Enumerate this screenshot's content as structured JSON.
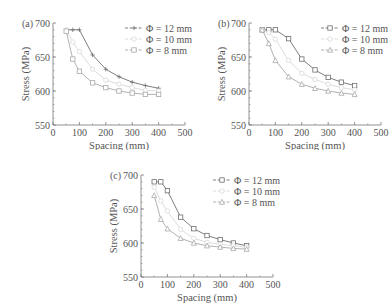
{
  "figure": {
    "colors": {
      "axis": "#777777",
      "s12": "#6f6f6f",
      "s10": "#d8d8d8",
      "s8": "#a8a8a8",
      "text": "#555555"
    }
  },
  "chart_data": [
    {
      "panel_label": "(a)",
      "type": "line",
      "title": "",
      "xlabel": "Spacing (mm)",
      "ylabel": "Stress (MPa)",
      "xlim": [
        0,
        500
      ],
      "ylim": [
        550,
        700
      ],
      "xticks": [
        0,
        100,
        200,
        300,
        400,
        500
      ],
      "yticks": [
        550,
        600,
        650,
        700
      ],
      "grid": false,
      "legend_position": "upper right",
      "x": [
        50,
        75,
        100,
        150,
        200,
        250,
        300,
        350,
        400
      ],
      "series": [
        {
          "name": "Φ = 12 mm",
          "marker": "plus",
          "values": [
            690,
            690,
            690,
            653,
            632,
            621,
            613,
            608,
            604
          ]
        },
        {
          "name": "Φ = 10 mm",
          "marker": "circle",
          "values": [
            690,
            672,
            658,
            632,
            616,
            610,
            605,
            601,
            600
          ]
        },
        {
          "name": "Φ = 8 mm",
          "marker": "square",
          "values": [
            688,
            647,
            629,
            612,
            605,
            600,
            597,
            595,
            595
          ]
        }
      ]
    },
    {
      "panel_label": "(b)",
      "type": "line",
      "title": "",
      "xlabel": "Spacing (mm)",
      "ylabel": "Stress (MPa)",
      "xlim": [
        0,
        500
      ],
      "ylim": [
        550,
        700
      ],
      "xticks": [
        0,
        100,
        200,
        300,
        400,
        500
      ],
      "yticks": [
        550,
        600,
        650,
        700
      ],
      "grid": false,
      "legend_position": "upper right",
      "x": [
        50,
        75,
        100,
        150,
        200,
        250,
        300,
        350,
        400
      ],
      "series": [
        {
          "name": "Φ = 12 mm",
          "marker": "square",
          "values": [
            690,
            690,
            690,
            677,
            647,
            631,
            620,
            613,
            608
          ]
        },
        {
          "name": "Φ = 10 mm",
          "marker": "circle",
          "values": [
            690,
            686,
            676,
            645,
            626,
            617,
            610,
            605,
            602
          ]
        },
        {
          "name": "Φ = 8 mm",
          "marker": "triangle",
          "values": [
            690,
            670,
            645,
            621,
            610,
            604,
            600,
            597,
            595
          ]
        }
      ]
    },
    {
      "panel_label": "(c)",
      "type": "line",
      "title": "",
      "xlabel": "Spacing (mm)",
      "ylabel": "Stress (MPa)",
      "xlim": [
        0,
        500
      ],
      "ylim": [
        550,
        700
      ],
      "xticks": [
        0,
        100,
        200,
        300,
        400,
        500
      ],
      "yticks": [
        550,
        600,
        650,
        700
      ],
      "grid": false,
      "legend_position": "upper right",
      "x": [
        50,
        75,
        100,
        150,
        200,
        250,
        300,
        350,
        400
      ],
      "series": [
        {
          "name": "Φ = 12 mm",
          "marker": "square",
          "values": [
            690,
            690,
            677,
            638,
            621,
            611,
            605,
            600,
            596
          ]
        },
        {
          "name": "Φ = 10 mm",
          "marker": "circle",
          "values": [
            682,
            662,
            647,
            620,
            607,
            601,
            598,
            596,
            594
          ]
        },
        {
          "name": "Φ = 8 mm",
          "marker": "triangle",
          "values": [
            670,
            635,
            621,
            607,
            600,
            596,
            594,
            592,
            591
          ]
        }
      ]
    }
  ]
}
